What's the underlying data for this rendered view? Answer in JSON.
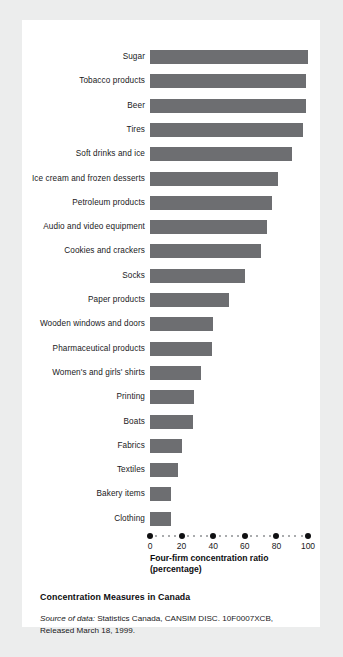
{
  "chart_data": {
    "type": "bar",
    "orientation": "horizontal",
    "title": "Concentration Measures in Canada",
    "xlabel": "Four-firm concentration ratio (percentage)",
    "xlabel_lines": [
      "Four-firm concentration ratio",
      "(percentage)"
    ],
    "ylabel": "",
    "xlim": [
      0,
      100
    ],
    "xticks": [
      0,
      20,
      40,
      60,
      80,
      100
    ],
    "xticklabels": [
      "0",
      "20",
      "40",
      "60",
      "80",
      "100"
    ],
    "minor_tick_step": 4,
    "grid": false,
    "legend": null,
    "bar_color": "#6d6e71",
    "categories": [
      "Sugar",
      "Tobacco products",
      "Beer",
      "Tires",
      "Soft drinks and ice",
      "Ice cream and frozen desserts",
      "Petroleum products",
      "Audio and video equipment",
      "Cookies and crackers",
      "Socks",
      "Paper products",
      "Wooden windows and doors",
      "Pharmaceutical products",
      "Women's and girls' shirts",
      "Printing",
      "Boats",
      "Fabrics",
      "Textiles",
      "Bakery items",
      "Clothing"
    ],
    "values": [
      100,
      99,
      99,
      97,
      90,
      81,
      77,
      74,
      70,
      60,
      50,
      40,
      39,
      32,
      28,
      27,
      20,
      18,
      13,
      13
    ]
  },
  "caption": {
    "title": "Concentration Measures in Canada",
    "source_lead": "Source of data:",
    "source_text": " Statistics Canada, CANSIM DISC. 10F0007XCB, Released March 18, 1999."
  }
}
